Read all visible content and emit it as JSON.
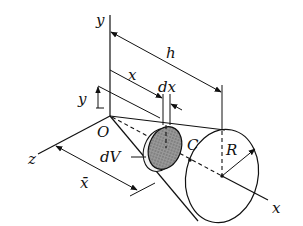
{
  "diagram": {
    "labels": {
      "y_axis": "y",
      "z_axis": "z",
      "x_axis": "x",
      "origin": "O",
      "height": "h",
      "x_dist": "x",
      "dx": "dx",
      "y_dim": "y",
      "dV": "dV",
      "centroid": "C",
      "radius": "R",
      "xbar": "x̄"
    },
    "colors": {
      "line": "#111111",
      "disk_fill": "#8a8a8a",
      "background": "#ffffff"
    }
  }
}
